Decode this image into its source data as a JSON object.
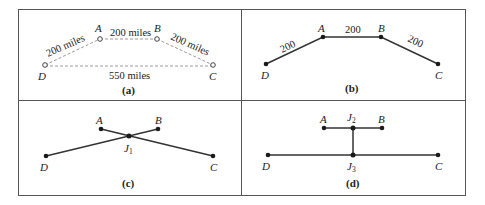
{
  "panels": {
    "a": {
      "caption": "(a)",
      "nodes": {
        "A": "A",
        "B": "B",
        "C": "C",
        "D": "D"
      },
      "edges": {
        "DA": "200 miles",
        "AB": "200 miles",
        "BC": "200 miles",
        "DC": "550 miles"
      }
    },
    "b": {
      "caption": "(b)",
      "nodes": {
        "A": "A",
        "B": "B",
        "C": "C",
        "D": "D"
      },
      "edges": {
        "DA": "200",
        "AB": "200",
        "BC": "200"
      }
    },
    "c": {
      "caption": "(c)",
      "nodes": {
        "A": "A",
        "B": "B",
        "C": "C",
        "D": "D",
        "J1": "J",
        "J1_sub": "1"
      }
    },
    "d": {
      "caption": "(d)",
      "nodes": {
        "A": "A",
        "B": "B",
        "C": "C",
        "D": "D",
        "J2": "J",
        "J2_sub": "2",
        "J3": "J",
        "J3_sub": "3"
      }
    }
  },
  "colors": {
    "frame": "#555555",
    "dashed_edge": "#9a9a9a",
    "solid_edge": "#333333",
    "node": "#1a1a1a"
  }
}
